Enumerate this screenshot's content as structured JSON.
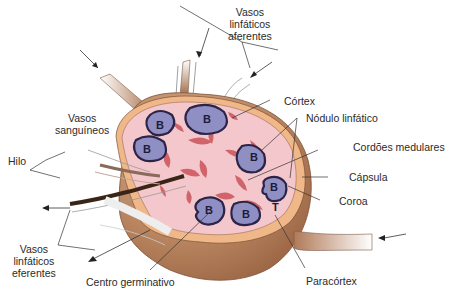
{
  "diagram": {
    "colors": {
      "background": "#ffffff",
      "medulla_outer": "#b98560",
      "medulla_dark": "#8e5a3a",
      "capsule": "#f0b888",
      "cortex_fill": "#f4c7cc",
      "medullary_cords": "#d0646a",
      "nodule_fill": "#8f8fc4",
      "nodule_border": "#2b2447",
      "line": "#333333"
    },
    "labels": {
      "afferent": [
        "Vasos",
        "linfáticos",
        "aferentes"
      ],
      "cortex": "Córtex",
      "nodule": "Nódulo linfático",
      "medullary_cords": "Cordões medulares",
      "capsule": "Cápsula",
      "corona": "Coroa",
      "paracortex": "Paracórtex",
      "germinal_center": "Centro germinativo",
      "efferent": [
        "Vasos",
        "linfáticos",
        "eferentes"
      ],
      "hilum": "Hilo",
      "blood_vessels": [
        "Vasos",
        "sanguíneos"
      ]
    },
    "nodule_letter": "B",
    "t_zone_letter": "T"
  }
}
